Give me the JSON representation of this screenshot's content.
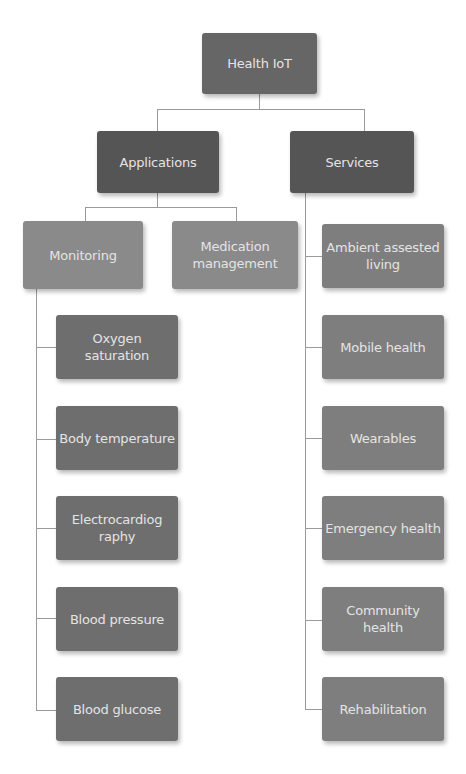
{
  "diagram": {
    "root": {
      "label": "Health IoT"
    },
    "branches": [
      {
        "label": "Applications",
        "children": [
          {
            "label": "Monitoring",
            "children": [
              {
                "label": "Oxygen saturation"
              },
              {
                "label": "Body temperature"
              },
              {
                "label": "Electrocardiog raphy"
              },
              {
                "label": "Blood pressure"
              },
              {
                "label": "Blood glucose"
              }
            ]
          },
          {
            "label": "Medication management"
          }
        ]
      },
      {
        "label": "Services",
        "children": [
          {
            "label": "Ambient assested living"
          },
          {
            "label": "Mobile health"
          },
          {
            "label": "Wearables"
          },
          {
            "label": "Emergency health"
          },
          {
            "label": "Community health"
          },
          {
            "label": "Rehabilitation"
          }
        ]
      }
    ]
  },
  "colors": {
    "root": "#666666",
    "level1": "#555555",
    "level2": "#8a8a8a",
    "leaf_monitoring": "#6e6e6e",
    "leaf_services": "#7e7e7e",
    "connector": "#9a9a9a",
    "text": "#e4e4e4"
  }
}
